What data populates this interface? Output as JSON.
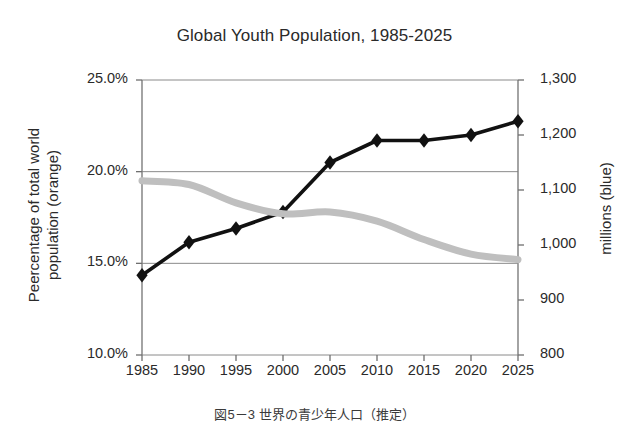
{
  "chart_data": {
    "type": "line",
    "title": "Global Youth Population, 1985-2025",
    "xlabel": "",
    "categories": [
      "1985",
      "1990",
      "1995",
      "2000",
      "2005",
      "2010",
      "2015",
      "2020",
      "2025"
    ],
    "grid": true,
    "legend_position": "none",
    "axes": {
      "left": {
        "label": "Peercentage of total world\npopulation (orange)",
        "ticks": [
          "10.0%",
          "15.0%",
          "20.0%",
          "25.0%"
        ],
        "tick_values": [
          10.0,
          15.0,
          20.0,
          25.0
        ],
        "ylim": [
          10.0,
          25.0
        ]
      },
      "right": {
        "label": "millions (blue)",
        "ticks": [
          "800",
          "900",
          "1,000",
          "1,100",
          "1,200",
          "1,300"
        ],
        "tick_values": [
          800,
          900,
          1000,
          1100,
          1200,
          1300
        ],
        "ylim": [
          800,
          1300
        ]
      }
    },
    "series": [
      {
        "name": "millions (blue)",
        "axis": "right",
        "color": "#111111",
        "marker": "diamond",
        "values": [
          945,
          1005,
          1030,
          1060,
          1150,
          1190,
          1190,
          1200,
          1225
        ]
      },
      {
        "name": "Peercentage of total world population (orange)",
        "axis": "left",
        "color": "#bfbfbf",
        "marker": "none",
        "values": [
          19.5,
          19.3,
          18.3,
          17.7,
          17.8,
          17.3,
          16.3,
          15.5,
          15.2
        ]
      }
    ]
  },
  "caption": {
    "text": "図5－3  世界の青少年人口（推定）"
  }
}
